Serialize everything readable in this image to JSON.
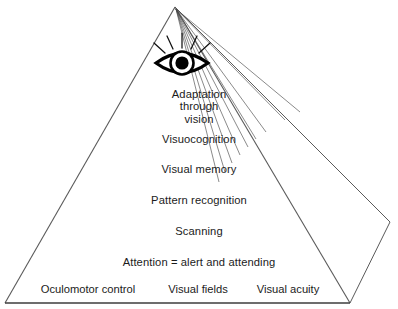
{
  "diagram": {
    "shape": "pyramid",
    "colors": {
      "outline": "#5a5a5a",
      "baseline": "#3c3c3c",
      "text": "#1b1b1b",
      "eye": "#000000",
      "background": "#ffffff"
    },
    "icon": {
      "name": "eye-icon",
      "label": "eye with radiating rays"
    },
    "levels": [
      {
        "id": "adaptation-through-vision",
        "lines": [
          "Adaptation",
          "through",
          "vision"
        ],
        "top": 88
      },
      {
        "id": "visuocognition",
        "lines": [
          "Visuocognition"
        ],
        "top": 133
      },
      {
        "id": "visual-memory",
        "lines": [
          "Visual memory"
        ],
        "top": 163
      },
      {
        "id": "pattern-recognition",
        "lines": [
          "Pattern recognition"
        ],
        "top": 194
      },
      {
        "id": "scanning",
        "lines": [
          "Scanning"
        ],
        "top": 225
      },
      {
        "id": "attention",
        "lines": [
          "Attention = alert and attending"
        ],
        "top": 256
      }
    ],
    "base_level": {
      "id": "foundation-skills",
      "cells": [
        {
          "id": "oculomotor-control",
          "label": "Oculomotor control",
          "center_x": 88
        },
        {
          "id": "visual-fields",
          "label": "Visual fields",
          "center_x": 198
        },
        {
          "id": "visual-acuity",
          "label": "Visual acuity",
          "center_x": 288
        }
      ]
    }
  }
}
